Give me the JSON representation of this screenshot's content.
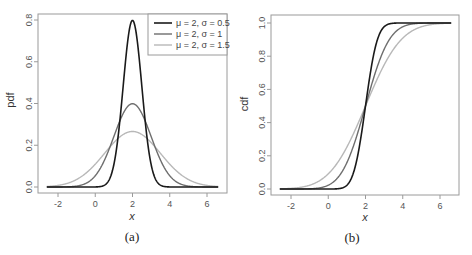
{
  "chart_data": [
    {
      "type": "line",
      "panel": "a",
      "caption": "(a)",
      "title": "",
      "xlabel": "x",
      "ylabel": "pdf",
      "xlim": [
        -2.6,
        6.6
      ],
      "ylim": [
        0,
        0.8
      ],
      "xticks": [
        -2,
        0,
        2,
        4,
        6
      ],
      "xtick_labels": [
        "-2",
        "0",
        "2",
        "4",
        "6"
      ],
      "yticks": [
        0.0,
        0.2,
        0.4,
        0.6,
        0.8
      ],
      "ytick_labels": [
        "0.0",
        "0.2",
        "0.4",
        "0.6",
        "0.8"
      ],
      "grid": false,
      "legend_position": "top-right",
      "function": "normal_pdf",
      "x": [
        -2,
        -1,
        0,
        1,
        1.5,
        2,
        2.5,
        3,
        4,
        5,
        6
      ],
      "series": [
        {
          "name": "μ = 2, σ = 0.5",
          "mu": 2,
          "sigma": 0.5,
          "color": "#1a1a1a",
          "width": 1.6,
          "values": [
            0.0,
            0.0,
            0.0003,
            0.108,
            0.484,
            0.798,
            0.484,
            0.108,
            0.0003,
            0.0,
            0.0
          ]
        },
        {
          "name": "μ = 2, σ = 1",
          "mu": 2,
          "sigma": 1,
          "color": "#6e6e6e",
          "width": 1.4,
          "values": [
            0.0001,
            0.0044,
            0.054,
            0.242,
            0.352,
            0.399,
            0.352,
            0.242,
            0.054,
            0.0044,
            0.0001
          ]
        },
        {
          "name": "μ = 2, σ = 1.5",
          "mu": 2,
          "sigma": 1.5,
          "color": "#b8b8b8",
          "width": 1.4,
          "values": [
            0.0076,
            0.036,
            0.109,
            0.213,
            0.252,
            0.266,
            0.252,
            0.213,
            0.109,
            0.036,
            0.0076
          ]
        }
      ]
    },
    {
      "type": "line",
      "panel": "b",
      "caption": "(b)",
      "title": "",
      "xlabel": "x",
      "ylabel": "cdf",
      "xlim": [
        -2.6,
        6.6
      ],
      "ylim": [
        0,
        1.0
      ],
      "xticks": [
        -2,
        0,
        2,
        4,
        6
      ],
      "xtick_labels": [
        "-2",
        "0",
        "2",
        "4",
        "6"
      ],
      "yticks": [
        0.0,
        0.2,
        0.4,
        0.6,
        0.8,
        1.0
      ],
      "ytick_labels": [
        "0.0",
        "0.2",
        "0.4",
        "0.6",
        "0.8",
        "1.0"
      ],
      "grid": false,
      "legend_position": "none",
      "function": "normal_cdf",
      "x": [
        -2,
        -1,
        0,
        1,
        1.5,
        2,
        2.5,
        3,
        4,
        5,
        6
      ],
      "series": [
        {
          "name": "μ = 2, σ = 0.5",
          "mu": 2,
          "sigma": 0.5,
          "color": "#1a1a1a",
          "width": 1.6,
          "values": [
            0.0,
            0.0,
            3e-05,
            0.023,
            0.159,
            0.5,
            0.841,
            0.977,
            1.0,
            1.0,
            1.0
          ]
        },
        {
          "name": "μ = 2, σ = 1",
          "mu": 2,
          "sigma": 1,
          "color": "#6e6e6e",
          "width": 1.4,
          "values": [
            3e-05,
            0.0013,
            0.023,
            0.159,
            0.309,
            0.5,
            0.691,
            0.841,
            0.977,
            0.9987,
            1.0
          ]
        },
        {
          "name": "μ = 2, σ = 1.5",
          "mu": 2,
          "sigma": 1.5,
          "color": "#b8b8b8",
          "width": 1.4,
          "values": [
            0.0038,
            0.023,
            0.091,
            0.252,
            0.369,
            0.5,
            0.631,
            0.748,
            0.909,
            0.977,
            0.9962
          ]
        }
      ]
    }
  ],
  "legend": {
    "items": [
      {
        "label": "μ = 2, σ = 0.5",
        "color": "#1a1a1a"
      },
      {
        "label": "μ = 2, σ = 1",
        "color": "#6e6e6e"
      },
      {
        "label": "μ = 2, σ = 1.5",
        "color": "#b8b8b8"
      }
    ]
  },
  "panels": {
    "a": {
      "caption": "(a)",
      "xlabel": "x",
      "ylabel": "pdf"
    },
    "b": {
      "caption": "(b)",
      "xlabel": "x",
      "ylabel": "cdf"
    }
  },
  "colors": {
    "axis": "#9a9a9a",
    "tick_text": "#555555"
  }
}
